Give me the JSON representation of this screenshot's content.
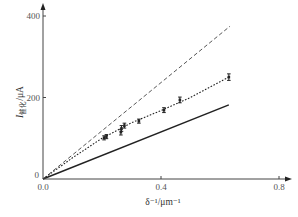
{
  "chart_data": {
    "type": "line",
    "title": "",
    "xlabel": "δ⁻¹/μm⁻¹",
    "ylabel": "I催化/μA",
    "ylabel_main": "I",
    "ylabel_sub": "催化",
    "ylabel_unit": "/μA",
    "xlim": [
      0,
      0.8
    ],
    "ylim": [
      0,
      400
    ],
    "x_ticks": [
      0.0,
      0.4,
      0.8
    ],
    "x_tick_labels": [
      "0.0",
      "0.4",
      "0.8"
    ],
    "y_ticks": [
      0,
      200,
      400
    ],
    "y_tick_labels": [
      "0",
      "200",
      "400"
    ],
    "grid": false,
    "legend": null,
    "series": [
      {
        "name": "upper-limit",
        "style": "long-dashed",
        "x": [
          0.0,
          0.634
        ],
        "y": [
          0,
          375
        ]
      },
      {
        "name": "measured-fit",
        "style": "short-dotted",
        "x": [
          0.0,
          0.1,
          0.2,
          0.3,
          0.4,
          0.5,
          0.63
        ],
        "y": [
          0,
          52,
          100,
          138,
          168,
          200,
          250
        ]
      },
      {
        "name": "lower-limit",
        "style": "solid",
        "x": [
          0.0,
          0.63
        ],
        "y": [
          0,
          182
        ]
      },
      {
        "name": "measurements",
        "style": "markers-with-error-bars",
        "x": [
          0.207,
          0.215,
          0.264,
          0.266,
          0.276,
          0.325,
          0.41,
          0.464,
          0.63
        ],
        "y": [
          101,
          104,
          115,
          124,
          131,
          142,
          169,
          194,
          250
        ],
        "error": [
          5,
          5,
          7,
          7,
          6,
          5,
          6,
          7,
          8
        ]
      }
    ]
  }
}
